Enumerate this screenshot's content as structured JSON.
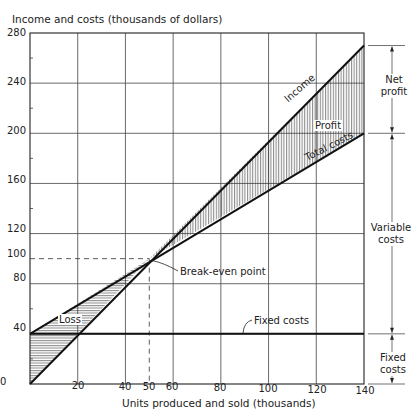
{
  "chart_data": {
    "type": "line",
    "title": "",
    "ylabel": "Income and costs (thousands of dollars)",
    "xlabel": "Units produced and sold (thousands)",
    "xlim": [
      0,
      140
    ],
    "ylim": [
      0,
      280
    ],
    "x_ticks": [
      0,
      20,
      40,
      50,
      60,
      80,
      100,
      120,
      140
    ],
    "y_ticks": [
      0,
      40,
      80,
      100,
      120,
      160,
      200,
      240,
      280
    ],
    "grid": true,
    "series": [
      {
        "name": "Income",
        "x": [
          0,
          140
        ],
        "y": [
          0,
          270
        ]
      },
      {
        "name": "Total costs",
        "x": [
          0,
          140
        ],
        "y": [
          40,
          200
        ]
      },
      {
        "name": "Fixed costs",
        "x": [
          0,
          140
        ],
        "y": [
          40,
          40
        ]
      }
    ],
    "break_even": {
      "x": 50,
      "y": 100,
      "label": "Break-even point"
    },
    "regions": [
      {
        "name": "Loss",
        "between": [
          "Total costs",
          "Income"
        ],
        "x_range": [
          0,
          50
        ],
        "hatch": "horizontal"
      },
      {
        "name": "Profit",
        "between": [
          "Income",
          "Total costs"
        ],
        "x_range": [
          50,
          140
        ],
        "hatch": "vertical"
      }
    ],
    "annotations": [
      "Income",
      "Total costs",
      "Profit",
      "Loss",
      "Fixed costs",
      "Break-even point",
      "Net profit",
      "Variable costs",
      "Fixed costs"
    ]
  },
  "labels": {
    "ylabel": "Income and costs (thousands of dollars)",
    "xlabel": "Units produced and sold (thousands)",
    "income": "Income",
    "total_costs": "Total costs",
    "profit": "Profit",
    "loss": "Loss",
    "fixed_costs": "Fixed costs",
    "break_even": "Break-even point",
    "net_profit_1": "Net",
    "net_profit_2": "profit",
    "variable_costs_1": "Variable",
    "variable_costs_2": "costs",
    "fixed_side_1": "Fixed",
    "fixed_side_2": "costs"
  },
  "ticks": {
    "y": [
      "280",
      "240",
      "200",
      "160",
      "120",
      "100",
      "80",
      "40",
      "0"
    ],
    "x": [
      "20",
      "40",
      "50",
      "60",
      "80",
      "100",
      "120",
      "140"
    ]
  }
}
